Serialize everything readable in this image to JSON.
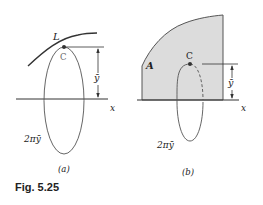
{
  "figure": {
    "caption": "Fig. 5.25",
    "panels": [
      {
        "id": "a",
        "label": "(a)",
        "curve_label": "L",
        "centroid_label": "C",
        "distance_label": "ȳ",
        "axis_label": "x",
        "circumference_label": "2πȳ"
      },
      {
        "id": "b",
        "label": "(b)",
        "area_label": "A",
        "centroid_label": "C",
        "distance_label": "ȳ",
        "axis_label": "x",
        "circumference_label": "2πȳ",
        "area_fill": "#d9d9d9"
      }
    ]
  }
}
